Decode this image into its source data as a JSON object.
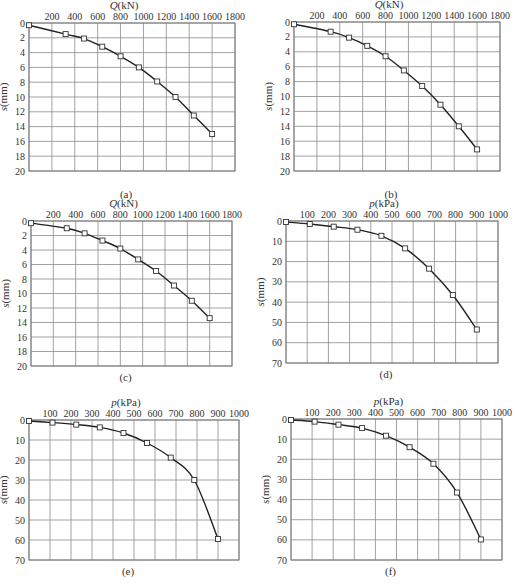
{
  "chart_data": [
    {
      "id": "a",
      "type": "line",
      "caption": "(a)",
      "xlabel": "Q(kN)",
      "ylabel": "s(mm)",
      "xlim": [
        0,
        1800
      ],
      "ylim": [
        0,
        20
      ],
      "y_inverted": true,
      "x_axis_position": "top",
      "grid": true,
      "xticks": [
        0,
        200,
        400,
        600,
        800,
        1000,
        1200,
        1400,
        1600,
        1800
      ],
      "yticks": [
        0,
        2,
        4,
        6,
        8,
        10,
        12,
        14,
        16,
        18,
        20
      ],
      "x": [
        0,
        320,
        480,
        640,
        800,
        960,
        1120,
        1280,
        1440,
        1600
      ],
      "y": [
        0.3,
        1.5,
        2.1,
        3.2,
        4.5,
        6.0,
        7.9,
        10.0,
        12.5,
        15.0
      ],
      "frame": {
        "x": 29,
        "y": 23,
        "w": 206,
        "h": 148
      }
    },
    {
      "id": "b",
      "type": "line",
      "caption": "(b)",
      "xlabel": "Q(kN)",
      "ylabel": "s(mm)",
      "xlim": [
        0,
        1800
      ],
      "ylim": [
        0,
        20
      ],
      "y_inverted": true,
      "x_axis_position": "top",
      "grid": true,
      "xticks": [
        0,
        200,
        400,
        600,
        800,
        1000,
        1200,
        1400,
        1600,
        1800
      ],
      "yticks": [
        0,
        2,
        4,
        6,
        8,
        10,
        12,
        14,
        16,
        18,
        20
      ],
      "x": [
        0,
        320,
        480,
        640,
        800,
        960,
        1120,
        1280,
        1440,
        1600
      ],
      "y": [
        0.3,
        1.3,
        2.1,
        3.2,
        4.6,
        6.5,
        8.6,
        11.1,
        14.0,
        17.1
      ],
      "frame": {
        "x": 294,
        "y": 22,
        "w": 206,
        "h": 149
      }
    },
    {
      "id": "c",
      "type": "line",
      "caption": "(c)",
      "xlabel": "Q(kN)",
      "ylabel": "s(mm)",
      "xlim": [
        0,
        1800
      ],
      "ylim": [
        0,
        20
      ],
      "y_inverted": true,
      "x_axis_position": "top",
      "grid": true,
      "xticks": [
        0,
        200,
        400,
        600,
        800,
        1000,
        1200,
        1400,
        1600,
        1800
      ],
      "yticks": [
        0,
        2,
        4,
        6,
        8,
        10,
        12,
        14,
        16,
        18,
        20
      ],
      "x": [
        0,
        320,
        480,
        640,
        800,
        960,
        1120,
        1280,
        1440,
        1600
      ],
      "y": [
        0.3,
        1.0,
        1.7,
        2.7,
        3.8,
        5.3,
        6.9,
        8.9,
        11.0,
        13.4
      ],
      "frame": {
        "x": 31,
        "y": 221,
        "w": 201,
        "h": 145
      }
    },
    {
      "id": "d",
      "type": "line",
      "caption": "(d)",
      "xlabel": "p(kPa)",
      "ylabel": "s(mm)",
      "xlim": [
        0,
        1000
      ],
      "ylim": [
        0,
        70
      ],
      "y_inverted": true,
      "x_axis_position": "top",
      "grid": true,
      "xticks": [
        0,
        100,
        200,
        300,
        400,
        500,
        600,
        700,
        800,
        900,
        1000
      ],
      "yticks": [
        0,
        10,
        20,
        30,
        40,
        50,
        60,
        70
      ],
      "x": [
        0,
        112,
        225,
        337,
        450,
        562,
        675,
        787,
        900
      ],
      "y": [
        0.5,
        1.5,
        2.8,
        4.3,
        7.3,
        13.5,
        23.5,
        36.5,
        53.5
      ],
      "frame": {
        "x": 286,
        "y": 221,
        "w": 212,
        "h": 142
      }
    },
    {
      "id": "e",
      "type": "line",
      "caption": "(e)",
      "xlabel": "p(kPa)",
      "ylabel": "s(mm)",
      "xlim": [
        0,
        1000
      ],
      "ylim": [
        0,
        70
      ],
      "y_inverted": true,
      "x_axis_position": "top",
      "grid": true,
      "xticks": [
        0,
        100,
        200,
        300,
        400,
        500,
        600,
        700,
        800,
        900,
        1000
      ],
      "yticks": [
        0,
        10,
        20,
        30,
        40,
        50,
        60,
        70
      ],
      "x": [
        0,
        112,
        225,
        337,
        450,
        562,
        675,
        787,
        900
      ],
      "y": [
        0.5,
        1.3,
        2.3,
        3.7,
        6.5,
        11.5,
        18.8,
        30.0,
        59.5
      ],
      "frame": {
        "x": 29,
        "y": 420,
        "w": 210,
        "h": 140
      }
    },
    {
      "id": "f",
      "type": "line",
      "caption": "(f)",
      "xlabel": "p(kPa)",
      "ylabel": "s(mm)",
      "xlim": [
        0,
        1000
      ],
      "ylim": [
        0,
        70
      ],
      "y_inverted": true,
      "x_axis_position": "top",
      "grid": true,
      "xticks": [
        0,
        100,
        200,
        300,
        400,
        500,
        600,
        700,
        800,
        900,
        1000
      ],
      "yticks": [
        0,
        10,
        20,
        30,
        40,
        50,
        60,
        70
      ],
      "x": [
        0,
        112,
        225,
        337,
        450,
        562,
        675,
        787,
        900
      ],
      "y": [
        0.5,
        1.3,
        2.8,
        4.5,
        8.3,
        14.0,
        22.2,
        36.5,
        59.8
      ],
      "frame": {
        "x": 291,
        "y": 419,
        "w": 211,
        "h": 141
      }
    }
  ]
}
